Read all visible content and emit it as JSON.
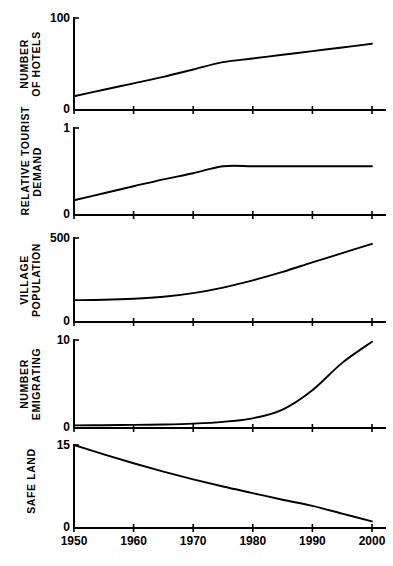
{
  "figure": {
    "background": "#ffffff",
    "ink": "#000000",
    "x_axis": {
      "label": "",
      "ticks": [
        1950,
        1960,
        1970,
        1980,
        1990,
        2000
      ],
      "tick_labels": [
        "1950",
        "1960",
        "1970",
        "1980",
        "1990",
        "2000"
      ],
      "range": [
        1950,
        2000
      ]
    }
  },
  "chart_data": [
    {
      "type": "line",
      "title": "",
      "panel_index": 0,
      "ylabel": "NUMBER OF HOTELS",
      "ylabel_lines": [
        "NUMBER",
        "OF HOTELS"
      ],
      "xlabel": "",
      "ylim": [
        0,
        100
      ],
      "ytick_labels": [
        "0",
        "100"
      ],
      "yticks": [
        0,
        100
      ],
      "xlim": [
        1950,
        2000
      ],
      "grid": false,
      "legend": "none",
      "x": [
        1950,
        1955,
        1960,
        1965,
        1970,
        1975,
        1980,
        1985,
        1990,
        1995,
        2000
      ],
      "values": [
        15,
        22,
        29,
        36,
        44,
        52,
        56,
        60,
        64,
        68,
        72
      ]
    },
    {
      "type": "line",
      "title": "",
      "panel_index": 1,
      "ylabel": "RELATIVE TOURIST DEMAND",
      "ylabel_lines": [
        "RELATIVE TOURIST",
        "DEMAND"
      ],
      "xlabel": "",
      "ylim": [
        0,
        1
      ],
      "ytick_labels": [
        "0",
        "1"
      ],
      "yticks": [
        0,
        1
      ],
      "xlim": [
        1950,
        2000
      ],
      "grid": false,
      "legend": "none",
      "x": [
        1950,
        1955,
        1960,
        1965,
        1970,
        1975,
        1980,
        1985,
        1990,
        1995,
        2000
      ],
      "values": [
        0.17,
        0.25,
        0.33,
        0.41,
        0.48,
        0.56,
        0.56,
        0.56,
        0.56,
        0.56,
        0.56
      ]
    },
    {
      "type": "line",
      "title": "",
      "panel_index": 2,
      "ylabel": "VILLAGE POPULATION",
      "ylabel_lines": [
        "VILLAGE",
        "POPULATION"
      ],
      "xlabel": "",
      "ylim": [
        0,
        500
      ],
      "ytick_labels": [
        "0",
        "500"
      ],
      "yticks": [
        0,
        500
      ],
      "xlim": [
        1950,
        2000
      ],
      "grid": false,
      "legend": "none",
      "x": [
        1950,
        1955,
        1960,
        1965,
        1970,
        1975,
        1980,
        1985,
        1990,
        1995,
        2000
      ],
      "values": [
        130,
        132,
        138,
        150,
        172,
        205,
        248,
        298,
        355,
        410,
        465
      ]
    },
    {
      "type": "line",
      "title": "",
      "panel_index": 3,
      "ylabel": "NUMBER EMIGRATING",
      "ylabel_lines": [
        "NUMBER",
        "EMIGRATING"
      ],
      "xlabel": "",
      "ylim": [
        0,
        10
      ],
      "ytick_labels": [
        "0",
        "10"
      ],
      "yticks": [
        0,
        10
      ],
      "xlim": [
        1950,
        2000
      ],
      "grid": false,
      "legend": "none",
      "x": [
        1950,
        1955,
        1960,
        1965,
        1970,
        1975,
        1980,
        1985,
        1990,
        1995,
        2000
      ],
      "values": [
        0.3,
        0.32,
        0.35,
        0.4,
        0.5,
        0.7,
        1.1,
        2.1,
        4.3,
        7.4,
        9.8
      ]
    },
    {
      "type": "line",
      "title": "",
      "panel_index": 4,
      "ylabel": "SAFE LAND",
      "ylabel_lines": [
        "SAFE LAND"
      ],
      "xlabel": "",
      "ylim": [
        0,
        15
      ],
      "ytick_labels": [
        "0",
        "15"
      ],
      "yticks": [
        0,
        15
      ],
      "xlim": [
        1950,
        2000
      ],
      "grid": false,
      "legend": "none",
      "x": [
        1950,
        1955,
        1960,
        1965,
        1970,
        1975,
        1980,
        1985,
        1990,
        1995,
        2000
      ],
      "values": [
        15.0,
        13.3,
        11.7,
        10.2,
        8.8,
        7.5,
        6.3,
        5.1,
        4.0,
        2.6,
        1.2
      ]
    }
  ]
}
